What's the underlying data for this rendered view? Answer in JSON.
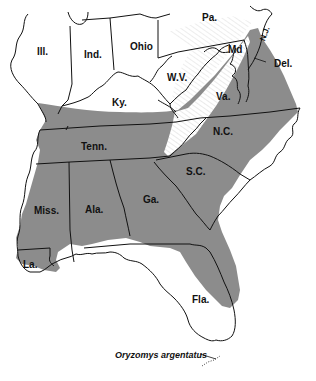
{
  "map": {
    "title": "Oryzomys argentatus",
    "type": "species distribution map",
    "colors": {
      "range_fill": "#8c8c8c",
      "outside_fill": "#ffffff",
      "border": "#111111",
      "mountain_hatch": "#9a9a9a"
    },
    "state_labels": [
      {
        "id": "ill",
        "label": "Ill."
      },
      {
        "id": "ind",
        "label": "Ind."
      },
      {
        "id": "ohio",
        "label": "Ohio"
      },
      {
        "id": "pa",
        "label": "Pa."
      },
      {
        "id": "md",
        "label": "Md"
      },
      {
        "id": "nj",
        "label": "N.J."
      },
      {
        "id": "del",
        "label": "Del."
      },
      {
        "id": "wv",
        "label": "W.V."
      },
      {
        "id": "ky",
        "label": "Ky."
      },
      {
        "id": "va",
        "label": "Va."
      },
      {
        "id": "tenn",
        "label": "Tenn."
      },
      {
        "id": "nc",
        "label": "N.C."
      },
      {
        "id": "sc",
        "label": "S.C."
      },
      {
        "id": "miss",
        "label": "Miss."
      },
      {
        "id": "ala",
        "label": "Ala."
      },
      {
        "id": "ga",
        "label": "Ga."
      },
      {
        "id": "la",
        "label": "La."
      },
      {
        "id": "fla",
        "label": "Fla."
      }
    ],
    "species_label": "Oryzomys argentatus"
  }
}
